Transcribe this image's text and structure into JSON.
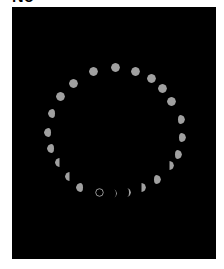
{
  "heading": {
    "text": "No"
  },
  "figure": {
    "background": "#000000",
    "moon_color": "#a0a0a0",
    "phases": [
      {
        "x": 99,
        "y": 192,
        "phase": "new"
      },
      {
        "x": 112,
        "y": 193,
        "phase": "waxing-crescent-thin"
      },
      {
        "x": 126,
        "y": 192,
        "phase": "waxing-crescent"
      },
      {
        "x": 141,
        "y": 187,
        "phase": "first-quarter"
      },
      {
        "x": 156,
        "y": 179,
        "phase": "waxing-gibbous-left-bite"
      },
      {
        "x": 169,
        "y": 165,
        "phase": "first-quarter"
      },
      {
        "x": 177,
        "y": 154,
        "phase": "waxing-gibbous"
      },
      {
        "x": 181,
        "y": 137,
        "phase": "waxing-gibbous"
      },
      {
        "x": 180,
        "y": 119,
        "phase": "waxing-gibbous"
      },
      {
        "x": 171,
        "y": 101,
        "phase": "full"
      },
      {
        "x": 162,
        "y": 88,
        "phase": "full"
      },
      {
        "x": 151,
        "y": 78,
        "phase": "full"
      },
      {
        "x": 135,
        "y": 71,
        "phase": "full"
      },
      {
        "x": 115,
        "y": 67,
        "phase": "full"
      },
      {
        "x": 93,
        "y": 71,
        "phase": "full"
      },
      {
        "x": 73,
        "y": 83,
        "phase": "full"
      },
      {
        "x": 60,
        "y": 96,
        "phase": "full"
      },
      {
        "x": 52,
        "y": 113,
        "phase": "waning-gibbous"
      },
      {
        "x": 48,
        "y": 132,
        "phase": "waning-gibbous"
      },
      {
        "x": 51,
        "y": 148,
        "phase": "waning-gibbous"
      },
      {
        "x": 59,
        "y": 162,
        "phase": "last-quarter"
      },
      {
        "x": 69,
        "y": 176,
        "phase": "last-quarter"
      },
      {
        "x": 80,
        "y": 187,
        "phase": "waning-gibbous"
      }
    ]
  }
}
